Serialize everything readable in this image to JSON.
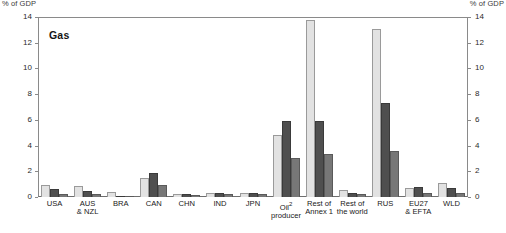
{
  "axis": {
    "left_unit": "% of GDP",
    "right_unit": "% of GDP",
    "ticks": [
      "0",
      "2",
      "4",
      "6",
      "8",
      "10",
      "12",
      "14"
    ]
  },
  "chart_data": {
    "type": "bar",
    "title": "Gas",
    "xlabel": "",
    "ylabel": "% of GDP",
    "ylim": [
      0,
      14
    ],
    "ytick_values": [
      0,
      2,
      4,
      6,
      8,
      10,
      12,
      14
    ],
    "grid": false,
    "legend_position": "none",
    "categories": [
      "USA",
      "AUS\n& NZL",
      "BRA",
      "CAN",
      "CHN",
      "IND",
      "JPN",
      "Oil²\nproducer",
      "Rest of\nAnnex 1",
      "Rest of\nthe world",
      "RUS",
      "EU27\n& EFTA",
      "WLD"
    ],
    "category_labels_plain": [
      "USA",
      "AUS & NZL",
      "BRA",
      "CAN",
      "CHN",
      "IND",
      "JPN",
      "Oil producer",
      "Rest of Annex 1",
      "Rest of the world",
      "RUS",
      "EU27 & EFTA",
      "WLD"
    ],
    "footnote_marker": "2",
    "series": [
      {
        "name": "series-1",
        "color": "#e2e2e2",
        "values": [
          0.95,
          0.85,
          0.4,
          1.5,
          0.25,
          0.3,
          0.3,
          4.85,
          13.8,
          0.55,
          13.05,
          0.7,
          1.1
        ]
      },
      {
        "name": "series-2",
        "color": "#4f4f4f",
        "values": [
          0.6,
          0.45,
          0.05,
          1.9,
          0.2,
          0.3,
          0.3,
          5.9,
          5.9,
          0.3,
          7.3,
          0.75,
          0.7
        ]
      },
      {
        "name": "series-3",
        "color": "#777777",
        "values": [
          0.25,
          0.2,
          0.02,
          0.9,
          0.15,
          0.25,
          0.25,
          3.05,
          3.35,
          0.22,
          3.6,
          0.35,
          0.35
        ]
      }
    ]
  }
}
